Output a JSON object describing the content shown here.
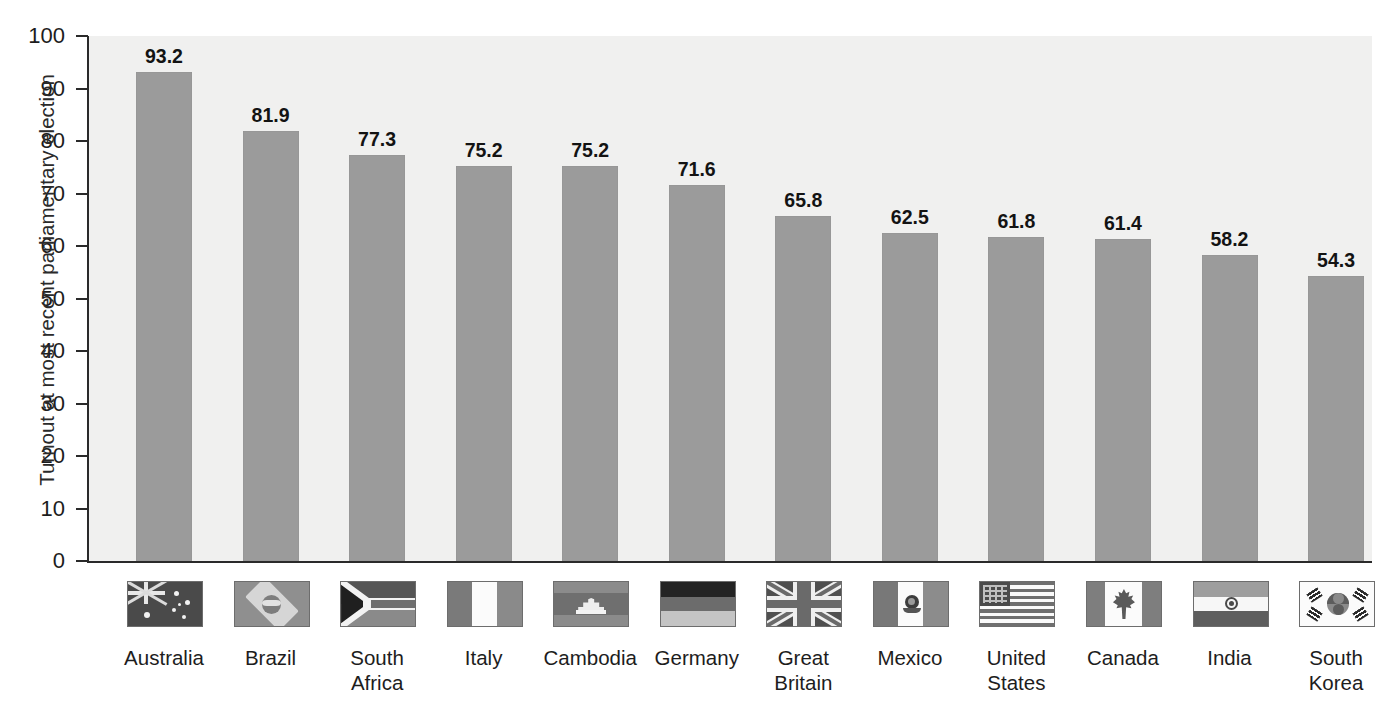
{
  "axis": {
    "y_label": "Turnout at most recent parliamentary election",
    "y_ticks": [
      "100",
      "90",
      "80",
      "70",
      "60",
      "50",
      "40",
      "30",
      "20",
      "10",
      "0"
    ]
  },
  "colors": {
    "bar_fill": "#9b9b9b",
    "plot_background": "#f0f0ef",
    "axis": "#2a2a2a",
    "title": "#b9b9bd",
    "text": "#1d1d1d"
  },
  "chart_data": {
    "type": "bar",
    "xlabel": "",
    "ylabel": "Turnout at most recent parliamentary election",
    "ylim": [
      0,
      100
    ],
    "ytick_step": 10,
    "grid": false,
    "legend": "none",
    "categories": [
      "Australia",
      "Brazil",
      "South Africa",
      "Italy",
      "Cambodia",
      "Germany",
      "Great Britain",
      "Mexico",
      "United States",
      "Canada",
      "India",
      "South Korea"
    ],
    "values": [
      93.2,
      81.9,
      77.3,
      75.2,
      75.2,
      71.6,
      65.8,
      62.5,
      61.8,
      61.4,
      58.2,
      54.3
    ],
    "value_labels": [
      "93.2",
      "81.9",
      "77.3",
      "75.2",
      "75.2",
      "71.6",
      "65.8",
      "62.5",
      "61.8",
      "61.4",
      "58.2",
      "54.3"
    ]
  },
  "countries": [
    {
      "name": "Australia",
      "lines": [
        "Australia"
      ],
      "value_label": "93.2",
      "flag": "flag-australia"
    },
    {
      "name": "Brazil",
      "lines": [
        "Brazil"
      ],
      "value_label": "81.9",
      "flag": "flag-brazil"
    },
    {
      "name": "South Africa",
      "lines": [
        "South",
        "Africa"
      ],
      "value_label": "77.3",
      "flag": "flag-south-africa"
    },
    {
      "name": "Italy",
      "lines": [
        "Italy"
      ],
      "value_label": "75.2",
      "flag": "flag-italy"
    },
    {
      "name": "Cambodia",
      "lines": [
        "Cambodia"
      ],
      "value_label": "75.2",
      "flag": "flag-cambodia"
    },
    {
      "name": "Germany",
      "lines": [
        "Germany"
      ],
      "value_label": "71.6",
      "flag": "flag-germany"
    },
    {
      "name": "Great Britain",
      "lines": [
        "Great",
        "Britain"
      ],
      "value_label": "65.8",
      "flag": "flag-great-britain"
    },
    {
      "name": "Mexico",
      "lines": [
        "Mexico"
      ],
      "value_label": "62.5",
      "flag": "flag-mexico"
    },
    {
      "name": "United States",
      "lines": [
        "United",
        "States"
      ],
      "value_label": "61.8",
      "flag": "flag-united-states"
    },
    {
      "name": "Canada",
      "lines": [
        "Canada"
      ],
      "value_label": "61.4",
      "flag": "flag-canada"
    },
    {
      "name": "India",
      "lines": [
        "India"
      ],
      "value_label": "58.2",
      "flag": "flag-india"
    },
    {
      "name": "South Korea",
      "lines": [
        "South",
        "Korea"
      ],
      "value_label": "54.3",
      "flag": "flag-south-korea"
    }
  ]
}
